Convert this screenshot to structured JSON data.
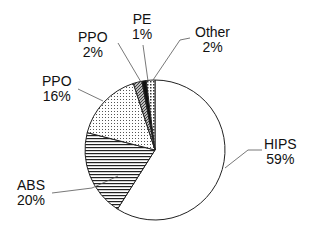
{
  "chart_data": {
    "type": "pie",
    "title": "",
    "start_angle": "12 o'clock, clockwise",
    "slices": [
      {
        "label": "HIPS",
        "value": 59,
        "pattern": "white"
      },
      {
        "label": "ABS",
        "value": 20,
        "pattern": "horizontal-lines"
      },
      {
        "label": "PPO",
        "value": 16,
        "pattern": "fine-dots"
      },
      {
        "label": "PPO",
        "value": 2,
        "pattern": "diagonal-hatch"
      },
      {
        "label": "PE",
        "value": 1,
        "pattern": "solid-black"
      },
      {
        "label": "Other",
        "value": 2,
        "pattern": "coarse-dots"
      }
    ],
    "labels": [
      {
        "name": "HIPS",
        "pct": "59%"
      },
      {
        "name": "ABS",
        "pct": "20%"
      },
      {
        "name": "PPO",
        "pct": "16%"
      },
      {
        "name": "PPO",
        "pct": "2%"
      },
      {
        "name": "PE",
        "pct": "1%"
      },
      {
        "name": "Other",
        "pct": "2%"
      }
    ]
  }
}
